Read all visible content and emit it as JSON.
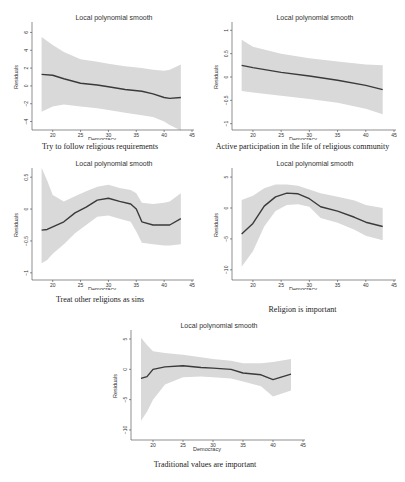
{
  "figure": {
    "panel_title": "Local polynomial smooth",
    "xlabel": "Democracy",
    "ylabel": "Residuals",
    "x_ticks": [
      20,
      25,
      30,
      35,
      40,
      45
    ]
  },
  "panels": [
    {
      "caption": "Try to follow religious requirements",
      "note": "kernel = epanechnikov, degree = 0, bandwidth = 5.26, pwidth = 7.9"
    },
    {
      "caption": "Active participation in the life of religious community",
      "note": "kernel = epanechnikov, degree = 0, bandwidth = 7.61, pwidth = 11.42"
    },
    {
      "caption": "Treat other religions as sins",
      "note": "kernel = epanechnikov, degree = 0, bandwidth = 2.11, pwidth = 3.16"
    },
    {
      "caption": "Religion is important",
      "note": "kernel = epanechnikov, degree = 0, bandwidth = 2.54, pwidth = 3.8"
    },
    {
      "caption": "Traditional values are important",
      "note": "kernel = epanechnikov, degree = 0, bandwidth = 2.69, pwidth = 4.03"
    }
  ],
  "chart_data": [
    {
      "type": "line",
      "title": "Local polynomial smooth",
      "subtitle": "Try to follow religious requirements",
      "xlabel": "Democracy",
      "ylabel": "Residuals",
      "xlim": [
        17,
        45
      ],
      "ylim": [
        -4.5,
        6.5
      ],
      "x_ticks": [
        20,
        25,
        30,
        35,
        40,
        45
      ],
      "y_ticks": [
        -4,
        -2,
        0,
        2,
        4,
        6
      ],
      "x": [
        18,
        20,
        22,
        25,
        28,
        30,
        33,
        36,
        38,
        40,
        41,
        43
      ],
      "series": [
        {
          "name": "smooth",
          "values": [
            1.3,
            1.2,
            0.8,
            0.3,
            0.1,
            -0.1,
            -0.4,
            -0.6,
            -0.9,
            -1.3,
            -1.4,
            -1.3
          ]
        },
        {
          "name": "ci_upper",
          "values": [
            5.5,
            4.6,
            3.8,
            3.0,
            2.7,
            2.5,
            2.2,
            2.0,
            1.8,
            1.7,
            1.8,
            2.4
          ]
        },
        {
          "name": "ci_lower",
          "values": [
            -2.9,
            -2.3,
            -2.1,
            -2.3,
            -2.5,
            -2.7,
            -3.0,
            -3.3,
            -3.5,
            -4.0,
            -4.4,
            -5.0
          ]
        }
      ]
    },
    {
      "type": "line",
      "title": "Local polynomial smooth",
      "subtitle": "Active participation in the life of religious community",
      "xlabel": "Democracy",
      "ylabel": "Residuals",
      "xlim": [
        17,
        45
      ],
      "ylim": [
        -1.05,
        1.05
      ],
      "x_ticks": [
        20,
        25,
        30,
        35,
        40,
        45
      ],
      "y_ticks": [
        -1,
        -0.5,
        0,
        0.5,
        1
      ],
      "x": [
        18,
        20,
        25,
        30,
        35,
        40,
        43
      ],
      "series": [
        {
          "name": "smooth",
          "values": [
            0.25,
            0.2,
            0.1,
            0.02,
            -0.07,
            -0.18,
            -0.27
          ]
        },
        {
          "name": "ci_upper",
          "values": [
            0.8,
            0.65,
            0.5,
            0.4,
            0.33,
            0.27,
            0.25
          ]
        },
        {
          "name": "ci_lower",
          "values": [
            -0.3,
            -0.33,
            -0.4,
            -0.47,
            -0.55,
            -0.68,
            -0.8
          ]
        }
      ]
    },
    {
      "type": "line",
      "title": "Local polynomial smooth",
      "subtitle": "Treat other religions as sins",
      "xlabel": "Democracy",
      "ylabel": "Residuals",
      "xlim": [
        17,
        45
      ],
      "ylim": [
        -1.05,
        0.55
      ],
      "x_ticks": [
        20,
        25,
        30,
        35,
        40,
        45
      ],
      "y_ticks": [
        -1,
        -0.5,
        0,
        0.5
      ],
      "x": [
        18,
        19,
        20,
        22,
        24,
        26,
        28,
        30,
        32,
        34,
        35,
        36,
        38,
        40,
        41,
        43
      ],
      "series": [
        {
          "name": "smooth",
          "values": [
            -0.33,
            -0.32,
            -0.28,
            -0.2,
            -0.06,
            0.03,
            0.14,
            0.17,
            0.12,
            0.08,
            0.0,
            -0.2,
            -0.25,
            -0.25,
            -0.25,
            -0.15
          ]
        },
        {
          "name": "ci_upper",
          "values": [
            0.65,
            0.45,
            0.22,
            0.12,
            0.2,
            0.28,
            0.35,
            0.38,
            0.33,
            0.3,
            0.25,
            0.1,
            0.08,
            0.1,
            0.12,
            0.25
          ]
        },
        {
          "name": "ci_lower",
          "values": [
            -0.85,
            -0.8,
            -0.7,
            -0.55,
            -0.38,
            -0.25,
            -0.12,
            -0.1,
            -0.15,
            -0.2,
            -0.35,
            -0.53,
            -0.55,
            -0.57,
            -0.57,
            -0.55
          ]
        }
      ]
    },
    {
      "type": "line",
      "title": "Local polynomial smooth",
      "subtitle": "Religion is important",
      "xlabel": "Democracy",
      "ylabel": "Residuals",
      "xlim": [
        17,
        45
      ],
      "ylim": [
        -11,
        5.5
      ],
      "x_ticks": [
        20,
        25,
        30,
        35,
        40,
        45
      ],
      "y_ticks": [
        -10,
        -5,
        0,
        5
      ],
      "x": [
        18,
        20,
        22,
        24,
        26,
        28,
        30,
        32,
        35,
        38,
        40,
        43
      ],
      "series": [
        {
          "name": "smooth",
          "values": [
            -4.2,
            -2.5,
            0.3,
            1.8,
            2.4,
            2.3,
            1.5,
            0.2,
            -0.5,
            -1.5,
            -2.3,
            -3.0
          ]
        },
        {
          "name": "ci_upper",
          "values": [
            1.3,
            2.0,
            3.2,
            3.8,
            3.8,
            3.6,
            3.0,
            2.4,
            1.8,
            1.2,
            0.5,
            0.0
          ]
        },
        {
          "name": "ci_lower",
          "values": [
            -9.5,
            -7.0,
            -3.0,
            -0.5,
            0.5,
            0.6,
            0.2,
            -1.6,
            -2.4,
            -3.5,
            -4.5,
            -5.2
          ]
        }
      ]
    },
    {
      "type": "line",
      "title": "Local polynomial smooth",
      "subtitle": "Traditional values are important",
      "xlabel": "Democracy",
      "ylabel": "Residuals",
      "xlim": [
        17,
        45
      ],
      "ylim": [
        -11,
        5.5
      ],
      "x_ticks": [
        20,
        25,
        30,
        35,
        40,
        45
      ],
      "y_ticks": [
        -10,
        -5,
        0,
        5
      ],
      "x": [
        18,
        19,
        20,
        22,
        25,
        28,
        30,
        33,
        35,
        38,
        40,
        43
      ],
      "series": [
        {
          "name": "smooth",
          "values": [
            -1.5,
            -1.2,
            0.0,
            0.4,
            0.6,
            0.3,
            0.2,
            0.0,
            -0.6,
            -0.9,
            -1.7,
            -0.8
          ]
        },
        {
          "name": "ci_upper",
          "values": [
            5.2,
            4.0,
            3.0,
            2.7,
            2.4,
            2.0,
            1.7,
            1.4,
            1.0,
            1.0,
            1.2,
            1.7
          ]
        },
        {
          "name": "ci_lower",
          "values": [
            -8.5,
            -7.0,
            -5.0,
            -2.5,
            -1.3,
            -1.2,
            -1.3,
            -1.5,
            -2.0,
            -2.8,
            -4.5,
            -3.5
          ]
        }
      ]
    }
  ]
}
